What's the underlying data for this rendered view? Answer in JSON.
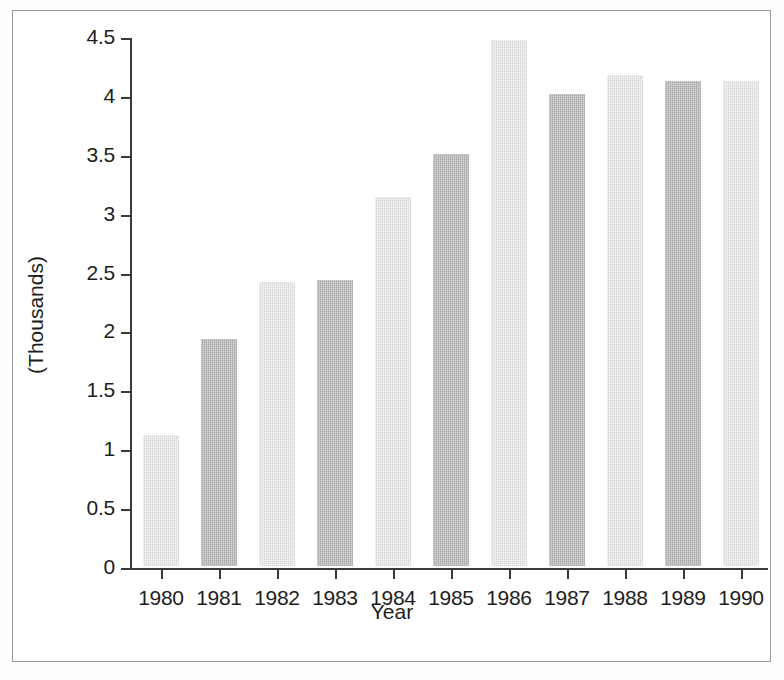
{
  "chart_data": {
    "type": "bar",
    "title": "",
    "subtitle": "",
    "xlabel": "Year",
    "ylabel": "(Thousands)",
    "categories": [
      "1980",
      "1981",
      "1982",
      "1983",
      "1984",
      "1985",
      "1986",
      "1987",
      "1988",
      "1989",
      "1990"
    ],
    "values": [
      1.11,
      1.93,
      2.41,
      2.43,
      3.13,
      3.5,
      4.47,
      4.01,
      4.17,
      4.12,
      4.12
    ],
    "series": [
      {
        "name": "",
        "values": [
          1.11,
          1.93,
          2.41,
          2.43,
          3.13,
          3.5,
          4.47,
          4.01,
          4.17,
          4.12,
          4.12
        ]
      }
    ],
    "bar_shades": [
      "light",
      "dark",
      "light",
      "dark",
      "light",
      "dark",
      "light",
      "dark",
      "light",
      "dark",
      "light"
    ],
    "ylim": [
      0,
      4.5
    ],
    "ytick_labels": [
      "0",
      "0.5",
      "1",
      "1.5",
      "2",
      "2.5",
      "3",
      "3.5",
      "4",
      "4.5"
    ],
    "ytick_values": [
      0,
      0.5,
      1,
      1.5,
      2,
      2.5,
      3,
      3.5,
      4,
      4.5
    ],
    "xtick_labels": [
      "1980",
      "1981",
      "1982",
      "1983",
      "1984",
      "1985",
      "1986",
      "1987",
      "1988",
      "1989",
      "1990"
    ],
    "grid": false,
    "legend": null,
    "legend_position": "none",
    "annotations": [],
    "colors": {
      "bar_light": "#d7d7d7",
      "bar_dark": "#a8a8a8",
      "axis": "#3a3a3a",
      "text": "#1d1d1d",
      "frame": "#9a9a9a",
      "background": "#ffffff"
    }
  }
}
